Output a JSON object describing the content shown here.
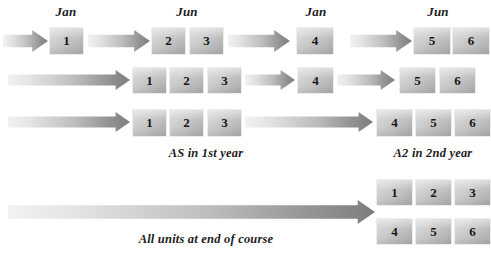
{
  "diagram": {
    "month_labels": [
      {
        "text": "Jan",
        "x": 66,
        "y": 4
      },
      {
        "text": "Jun",
        "x": 187,
        "y": 4
      },
      {
        "text": "Jan",
        "x": 316,
        "y": 4
      },
      {
        "text": "Jun",
        "x": 438,
        "y": 4
      }
    ],
    "captions": [
      {
        "text": "AS in 1st year",
        "x": 206,
        "y": 146
      },
      {
        "text": "A2 in 2nd year",
        "x": 433,
        "y": 146
      },
      {
        "text": "All units at end of course",
        "x": 206,
        "y": 232
      }
    ],
    "rows": [
      {
        "name": "row-1",
        "arrows": [
          {
            "x": 3,
            "y": 30,
            "w": 45,
            "h": 22
          },
          {
            "x": 88,
            "y": 30,
            "w": 62,
            "h": 22
          },
          {
            "x": 228,
            "y": 30,
            "w": 62,
            "h": 22
          },
          {
            "x": 350,
            "y": 30,
            "w": 62,
            "h": 22
          }
        ],
        "boxes": [
          {
            "label": "1",
            "x": 50,
            "y": 28,
            "w": 33,
            "h": 26
          },
          {
            "label": "2",
            "x": 152,
            "y": 28,
            "w": 33,
            "h": 26
          },
          {
            "label": "3",
            "x": 190,
            "y": 28,
            "w": 33,
            "h": 26
          },
          {
            "label": "4",
            "x": 297,
            "y": 28,
            "w": 36,
            "h": 26
          },
          {
            "label": "5",
            "x": 414,
            "y": 28,
            "w": 36,
            "h": 26
          },
          {
            "label": "6",
            "x": 453,
            "y": 28,
            "w": 36,
            "h": 26
          }
        ]
      },
      {
        "name": "row-2",
        "arrows": [
          {
            "x": 8,
            "y": 70,
            "w": 122,
            "h": 20
          },
          {
            "x": 245,
            "y": 70,
            "w": 50,
            "h": 20
          },
          {
            "x": 337,
            "y": 70,
            "w": 58,
            "h": 20
          }
        ],
        "boxes": [
          {
            "label": "1",
            "x": 133,
            "y": 68,
            "w": 33,
            "h": 25
          },
          {
            "label": "2",
            "x": 170,
            "y": 68,
            "w": 33,
            "h": 25
          },
          {
            "label": "3",
            "x": 208,
            "y": 68,
            "w": 33,
            "h": 25
          },
          {
            "label": "4",
            "x": 298,
            "y": 68,
            "w": 35,
            "h": 25
          },
          {
            "label": "5",
            "x": 400,
            "y": 68,
            "w": 35,
            "h": 25
          },
          {
            "label": "6",
            "x": 440,
            "y": 68,
            "w": 35,
            "h": 25
          }
        ]
      },
      {
        "name": "row-3",
        "arrows": [
          {
            "x": 8,
            "y": 112,
            "w": 122,
            "h": 20
          },
          {
            "x": 245,
            "y": 112,
            "w": 128,
            "h": 20
          }
        ],
        "boxes": [
          {
            "label": "1",
            "x": 133,
            "y": 110,
            "w": 33,
            "h": 26
          },
          {
            "label": "2",
            "x": 170,
            "y": 110,
            "w": 33,
            "h": 26
          },
          {
            "label": "3",
            "x": 208,
            "y": 110,
            "w": 33,
            "h": 26
          },
          {
            "label": "4",
            "x": 377,
            "y": 110,
            "w": 35,
            "h": 26
          },
          {
            "label": "5",
            "x": 416,
            "y": 110,
            "w": 35,
            "h": 26
          },
          {
            "label": "6",
            "x": 455,
            "y": 110,
            "w": 35,
            "h": 26
          }
        ]
      },
      {
        "name": "row-4",
        "arrows": [
          {
            "x": 8,
            "y": 200,
            "w": 367,
            "h": 24
          }
        ],
        "boxes": [
          {
            "label": "1",
            "x": 377,
            "y": 180,
            "w": 35,
            "h": 25
          },
          {
            "label": "2",
            "x": 416,
            "y": 180,
            "w": 35,
            "h": 25
          },
          {
            "label": "3",
            "x": 455,
            "y": 180,
            "w": 35,
            "h": 25
          },
          {
            "label": "4",
            "x": 377,
            "y": 219,
            "w": 35,
            "h": 25
          },
          {
            "label": "5",
            "x": 416,
            "y": 219,
            "w": 35,
            "h": 25
          },
          {
            "label": "6",
            "x": 455,
            "y": 219,
            "w": 35,
            "h": 25
          }
        ]
      }
    ],
    "colors": {
      "arrow_light": "#f2f2f2",
      "arrow_dark": "#7d7d7d",
      "box_light": "#dcdcdc",
      "box_dark": "#a9a9a9",
      "text": "#1c1c1c",
      "background": "#ffffff"
    }
  }
}
